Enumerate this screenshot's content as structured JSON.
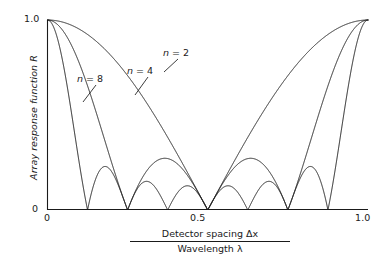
{
  "figure": {
    "background_color": "#ffffff",
    "axis_color": "#1a1a1a",
    "curve_color": "#1a1a1a"
  },
  "axes": {
    "y_title": "Array response function R",
    "y_ticks": [
      "1.0",
      "0"
    ],
    "x_ticks": [
      "0",
      "0.5",
      "1.0"
    ],
    "x_title_numerator": "Detector spacing Δx",
    "x_title_denominator": "Wavelength λ"
  },
  "annotations": [
    {
      "id": "n8",
      "prefix": "n",
      "text": " = 8"
    },
    {
      "id": "n4",
      "prefix": "n",
      "text": " = 4"
    },
    {
      "id": "n2",
      "prefix": "n",
      "text": " = 2"
    }
  ],
  "chart_data": {
    "type": "line",
    "title": "",
    "xlabel": "Detector spacing Δx / Wavelength λ",
    "ylabel": "Array response function R",
    "xlim": [
      0,
      1.0
    ],
    "ylim": [
      0,
      1.0
    ],
    "xticks": [
      0,
      0.5,
      1.0
    ],
    "xticklabels": [
      "0",
      "0.5",
      "1.0"
    ],
    "yticks": [
      0,
      1.0
    ],
    "yticklabels": [
      "0",
      "1.0"
    ],
    "grid": false,
    "legend": "inline-annotations",
    "formula": "R = |sin(n*pi*u) / (n*sin(pi*u))|, u = Detector spacing / Wavelength",
    "series": [
      {
        "name": "n = 2",
        "n": 2,
        "label": "n = 2",
        "zeros": [
          0.5
        ],
        "peaks": [
          {
            "x": 0.0,
            "y": 1.0
          },
          {
            "x": 1.0,
            "y": 1.0
          }
        ],
        "x": [
          0,
          0.05,
          0.1,
          0.15,
          0.2,
          0.25,
          0.3,
          0.35,
          0.4,
          0.45,
          0.5,
          0.55,
          0.6,
          0.65,
          0.7,
          0.75,
          0.8,
          0.85,
          0.9,
          0.95,
          1.0
        ],
        "y": [
          1.0,
          0.988,
          0.951,
          0.891,
          0.809,
          0.707,
          0.588,
          0.454,
          0.309,
          0.156,
          0.0,
          0.156,
          0.309,
          0.454,
          0.588,
          0.707,
          0.809,
          0.891,
          0.951,
          0.988,
          1.0
        ]
      },
      {
        "name": "n = 4",
        "n": 4,
        "label": "n = 4",
        "zeros": [
          0.25,
          0.5,
          0.75
        ],
        "peaks": [
          {
            "x": 0.0,
            "y": 1.0
          },
          {
            "x": 0.375,
            "y": 0.3
          },
          {
            "x": 0.625,
            "y": 0.3
          },
          {
            "x": 1.0,
            "y": 1.0
          }
        ],
        "x": [
          0,
          0.05,
          0.1,
          0.15,
          0.2,
          0.25,
          0.3,
          0.35,
          0.4,
          0.45,
          0.5,
          0.55,
          0.6,
          0.65,
          0.7,
          0.75,
          0.8,
          0.85,
          0.9,
          0.95,
          1.0
        ],
        "y": [
          1.0,
          0.951,
          0.809,
          0.588,
          0.309,
          0.0,
          0.234,
          0.3,
          0.262,
          0.151,
          0.0,
          0.151,
          0.262,
          0.3,
          0.234,
          0.0,
          0.309,
          0.588,
          0.809,
          0.951,
          1.0
        ]
      },
      {
        "name": "n = 8",
        "n": 8,
        "label": "n = 8",
        "zeros": [
          0.125,
          0.25,
          0.375,
          0.5,
          0.625,
          0.75,
          0.875
        ],
        "peaks": [
          {
            "x": 0.0,
            "y": 1.0
          },
          {
            "x": 0.1875,
            "y": 0.21
          },
          {
            "x": 0.3125,
            "y": 0.14
          },
          {
            "x": 0.4375,
            "y": 0.13
          },
          {
            "x": 0.5625,
            "y": 0.13
          },
          {
            "x": 0.6875,
            "y": 0.14
          },
          {
            "x": 0.8125,
            "y": 0.21
          },
          {
            "x": 1.0,
            "y": 1.0
          }
        ],
        "x": [
          0,
          0.025,
          0.05,
          0.075,
          0.1,
          0.125,
          0.15,
          0.1875,
          0.225,
          0.25,
          0.2875,
          0.3125,
          0.35,
          0.375,
          0.4125,
          0.4375,
          0.475,
          0.5,
          0.525,
          0.5625,
          0.6,
          0.625,
          0.6625,
          0.6875,
          0.725,
          0.75,
          0.7875,
          0.8125,
          0.85,
          0.875,
          0.9,
          0.925,
          0.95,
          0.975,
          1.0
        ],
        "y": [
          1.0,
          0.951,
          0.809,
          0.588,
          0.309,
          0.0,
          0.162,
          0.212,
          0.154,
          0.0,
          0.128,
          0.144,
          0.113,
          0.0,
          0.118,
          0.131,
          0.107,
          0.0,
          0.107,
          0.131,
          0.118,
          0.0,
          0.113,
          0.144,
          0.128,
          0.0,
          0.154,
          0.212,
          0.162,
          0.0,
          0.309,
          0.588,
          0.809,
          0.951,
          1.0
        ]
      }
    ]
  }
}
